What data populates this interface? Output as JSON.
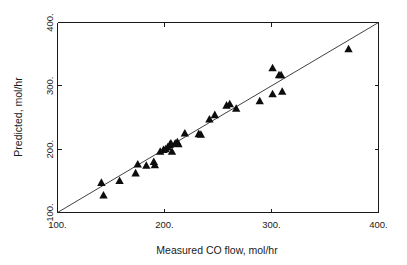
{
  "chart_data": {
    "type": "scatter",
    "title": "",
    "xlabel": "Measured CO flow, mol/hr",
    "ylabel": "Predicted, mol/hr",
    "xlim": [
      100,
      400
    ],
    "ylim": [
      100,
      400
    ],
    "xticks": [
      100,
      200,
      300,
      400
    ],
    "yticks": [
      100,
      200,
      300,
      400
    ],
    "xtick_labels": [
      "100.",
      "200.",
      "300.",
      "400."
    ],
    "ytick_labels": [
      "100.",
      "200.",
      "300.",
      "400."
    ],
    "grid": false,
    "legend": null,
    "marker": "triangle-up",
    "marker_color": "#0d0d0d",
    "reference_line": {
      "name": "parity-line",
      "type": "line",
      "slope": 1,
      "intercept": 0,
      "x": [
        100,
        400
      ],
      "y": [
        100,
        400
      ],
      "color": "#2b2b2b"
    },
    "series": [
      {
        "name": "Predicted vs Measured CO flow",
        "points": [
          [
            141,
            147
          ],
          [
            143,
            127
          ],
          [
            158,
            150
          ],
          [
            173,
            162
          ],
          [
            175,
            176
          ],
          [
            183,
            174
          ],
          [
            190,
            180
          ],
          [
            191,
            175
          ],
          [
            196,
            196
          ],
          [
            199,
            199
          ],
          [
            201,
            200
          ],
          [
            203,
            203
          ],
          [
            205,
            207
          ],
          [
            206,
            209
          ],
          [
            207,
            196
          ],
          [
            210,
            209
          ],
          [
            212,
            211
          ],
          [
            213,
            208
          ],
          [
            219,
            225
          ],
          [
            232,
            224
          ],
          [
            234,
            223
          ],
          [
            242,
            247
          ],
          [
            247,
            254
          ],
          [
            258,
            269
          ],
          [
            261,
            271
          ],
          [
            267,
            264
          ],
          [
            289,
            276
          ],
          [
            301,
            328
          ],
          [
            301,
            287
          ],
          [
            307,
            317
          ],
          [
            309,
            317
          ],
          [
            310,
            291
          ],
          [
            372,
            358
          ]
        ]
      }
    ]
  },
  "axes": {
    "xlabel": "Measured CO flow, mol/hr",
    "ylabel": "Predicted, mol/hr"
  }
}
